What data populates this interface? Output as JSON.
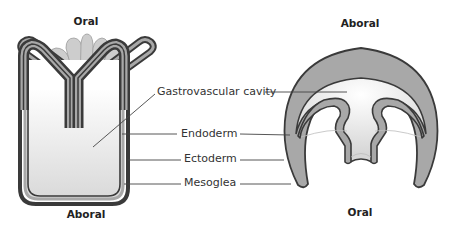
{
  "polyp": {
    "top_label": "Oral",
    "bottom_label": "Aboral"
  },
  "medusa": {
    "top_label": "Aboral",
    "bottom_label": "Oral"
  },
  "labels": {
    "gastrovascular_cavity": "Gastrovascular cavity",
    "endoderm": "Endoderm",
    "ectoderm": "Ectoderm",
    "mesoglea": "Mesoglea"
  },
  "colors": {
    "outline": "#3a3a3a",
    "mesoglea_fill": "#a8a8a8",
    "tentacle_fill": "#cfcfcf",
    "cavity_light": "#f7f7f7",
    "cavity_dark": "#dcdcdc",
    "leader_line": "#444444"
  }
}
